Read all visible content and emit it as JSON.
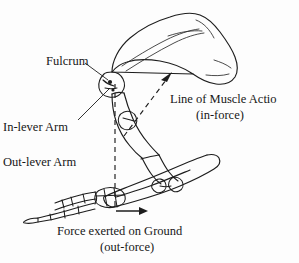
{
  "figure": {
    "background_color": "#fdfdfd",
    "ink_color": "#1a1a1a"
  },
  "labels": {
    "fulcrum": "Fulcrum",
    "in_lever_arm": "In-lever Arm",
    "out_lever_arm": "Out-lever Arm",
    "line_of_muscle_action": "Line of Muscle Actio",
    "in_force": "(in-force)",
    "force_on_ground": "Force exerted on Ground",
    "out_force": "(out-force)"
  },
  "annotations": {
    "in_force_arrow_name": "in-force-arrow",
    "out_force_arrow_name": "out-force-arrow",
    "out_lever_dashed_line_name": "out-lever-dashed-line",
    "fulcrum_leader_name": "fulcrum-leader-line",
    "in_lever_leader_name": "in-lever-leader-line"
  }
}
